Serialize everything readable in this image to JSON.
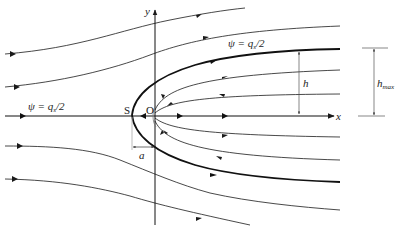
{
  "diagram": {
    "type": "streamline-flow-half-body",
    "axes": {
      "x_label": "x",
      "y_label": "y"
    },
    "points": {
      "stagnation_label": "S",
      "origin_label": "O"
    },
    "labels": {
      "psi_upper_prefix": "ψ = q",
      "psi_upper_sub": "s",
      "psi_upper_suffix": "/2",
      "psi_axis_prefix": "ψ = q",
      "psi_axis_sub": "s",
      "psi_axis_suffix": "/2",
      "h": "h",
      "hmax_main": "h",
      "hmax_sub": "max",
      "a": "a"
    },
    "colors": {
      "line": "#1a1a1a",
      "dim": "#555555",
      "background": "#ffffff"
    }
  }
}
